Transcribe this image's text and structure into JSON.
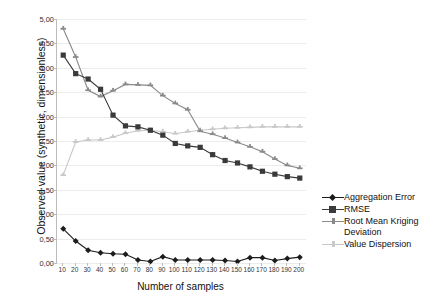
{
  "chart_data": {
    "type": "line",
    "title": "",
    "xlabel": "Number of samples",
    "ylabel": "Observed value (synthetic, dimensionless)",
    "x": [
      10,
      20,
      30,
      40,
      50,
      60,
      70,
      80,
      90,
      100,
      110,
      120,
      130,
      140,
      150,
      160,
      170,
      180,
      190,
      200
    ],
    "xticklabels": [
      "10",
      "20",
      "30",
      "40",
      "50",
      "60",
      "70",
      "80",
      "90",
      "100",
      "110",
      "120",
      "130",
      "140",
      "150",
      "160",
      "170",
      "180",
      "190",
      "200"
    ],
    "yticklabels": [
      "0,00",
      "0,50",
      "1,00",
      "1,50",
      "2,00",
      "2,50",
      "3,00",
      "3,50",
      "4,00",
      "4,50",
      "5,00"
    ],
    "ylim": [
      0.0,
      5.0
    ],
    "ytick_step": 0.5,
    "grid": true,
    "legend_position": "right",
    "series": [
      {
        "name": "Aggregation Error",
        "color": "#1c1c1c",
        "marker": "diamond",
        "values": [
          0.7,
          0.45,
          0.26,
          0.21,
          0.19,
          0.18,
          0.06,
          0.03,
          0.13,
          0.06,
          0.06,
          0.06,
          0.06,
          0.05,
          0.03,
          0.11,
          0.11,
          0.05,
          0.09,
          0.12
        ]
      },
      {
        "name": "RMSE",
        "color": "#3a3a3a",
        "marker": "square",
        "values": [
          4.26,
          3.88,
          3.77,
          3.56,
          3.03,
          2.81,
          2.79,
          2.72,
          2.62,
          2.45,
          2.4,
          2.37,
          2.22,
          2.1,
          2.05,
          1.97,
          1.88,
          1.82,
          1.77,
          1.74
        ]
      },
      {
        "name": "Root Mean Kriging Deviation",
        "color": "#8a8a8a",
        "marker": "cross",
        "values": [
          4.8,
          4.22,
          3.54,
          3.41,
          3.53,
          3.66,
          3.65,
          3.64,
          3.43,
          3.27,
          3.14,
          2.7,
          2.64,
          2.56,
          2.47,
          2.38,
          2.28,
          2.13,
          2.0,
          1.94
        ]
      },
      {
        "name": "Value Dispersion",
        "color": "#c8c8c8",
        "marker": "cross",
        "values": [
          1.8,
          2.48,
          2.52,
          2.52,
          2.58,
          2.66,
          2.71,
          2.72,
          2.69,
          2.65,
          2.69,
          2.72,
          2.74,
          2.76,
          2.77,
          2.78,
          2.79,
          2.79,
          2.79,
          2.79
        ]
      }
    ]
  },
  "legend": {
    "items": [
      {
        "label": "Aggregation Error"
      },
      {
        "label": "RMSE"
      },
      {
        "label": "Root Mean Kriging Deviation"
      },
      {
        "label": "Value Dispersion"
      }
    ]
  }
}
